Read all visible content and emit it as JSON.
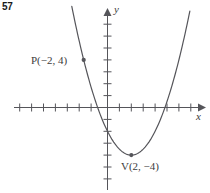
{
  "figure": {
    "problem_number": "57",
    "axis_x_label": "x",
    "axis_y_label": "y",
    "point_label_P": "P(−2, 4)",
    "point_label_V": "V(2, −4)",
    "stroke_color": "#55555a",
    "text_color": "#3c3c3c",
    "background_color": "#ffffff"
  },
  "chart_data": {
    "type": "line",
    "title": "",
    "subtitle": "",
    "xlabel": "x",
    "ylabel": "y",
    "xlim": [
      -8,
      8
    ],
    "ylim": [
      -8,
      8
    ],
    "grid": false,
    "legend": "none",
    "tick_spacing_x": 1,
    "tick_spacing_y": 1,
    "curve": {
      "name": "parabola",
      "equation": "y = 0.5(x − 2)^2 − 4",
      "vertex": [
        2,
        -4
      ],
      "opens": "up",
      "x_intercepts": [
        -0.83,
        4.83
      ],
      "y_intercept": -2,
      "x": [
        -2.0,
        -1.5,
        -1.0,
        -0.5,
        0.0,
        0.5,
        1.0,
        1.5,
        2.0,
        2.5,
        3.0,
        3.5,
        4.0,
        4.5,
        5.0,
        5.5,
        6.0
      ],
      "y": [
        4.0,
        2.125,
        0.5,
        -0.875,
        -2.0,
        -2.875,
        -3.5,
        -3.875,
        -4.0,
        -3.875,
        -3.5,
        -2.875,
        -2.0,
        -0.875,
        0.5,
        2.125,
        4.0
      ]
    },
    "points": [
      {
        "name": "P",
        "label": "P(−2, 4)",
        "x": -2,
        "y": 4
      },
      {
        "name": "V",
        "label": "V(2, −4)",
        "x": 2,
        "y": -4
      }
    ],
    "annotations": [
      {
        "text": "P(−2, 4)",
        "x": -2,
        "y": 4
      },
      {
        "text": "V(2, −4)",
        "x": 2,
        "y": -4
      }
    ]
  }
}
